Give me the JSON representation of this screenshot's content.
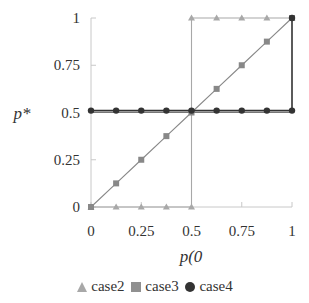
{
  "chart_data": {
    "type": "line",
    "title": "",
    "xlabel": "p(0",
    "ylabel": "p*",
    "xlim": [
      0,
      1
    ],
    "ylim": [
      0,
      1
    ],
    "grid": false,
    "legend_position": "bottom",
    "x_ticks": [
      "0",
      "0.25",
      "0.5",
      "0.75",
      "1"
    ],
    "y_ticks": [
      "0",
      "0.25",
      "0.5",
      "0.75",
      "1"
    ],
    "series": [
      {
        "name": "case2",
        "marker": "triangle",
        "color": "#a8a8a8",
        "points": [
          [
            0,
            0
          ],
          [
            0.125,
            0
          ],
          [
            0.25,
            0
          ],
          [
            0.375,
            0
          ],
          [
            0.5,
            0
          ],
          [
            0.5,
            1
          ],
          [
            0.625,
            1
          ],
          [
            0.75,
            1
          ],
          [
            0.875,
            1
          ],
          [
            1,
            1
          ]
        ]
      },
      {
        "name": "case3",
        "marker": "square",
        "color": "#888888",
        "points": [
          [
            0,
            0
          ],
          [
            0.125,
            0.125
          ],
          [
            0.25,
            0.25
          ],
          [
            0.375,
            0.375
          ],
          [
            0.5,
            0.5
          ],
          [
            0.625,
            0.625
          ],
          [
            0.75,
            0.75
          ],
          [
            0.875,
            0.875
          ],
          [
            1,
            1
          ]
        ]
      },
      {
        "name": "case4",
        "marker": "circle",
        "color": "#333333",
        "points": [
          [
            0,
            0.51
          ],
          [
            0.125,
            0.51
          ],
          [
            0.25,
            0.51
          ],
          [
            0.375,
            0.51
          ],
          [
            0.5,
            0.51
          ],
          [
            0.625,
            0.51
          ],
          [
            0.75,
            0.51
          ],
          [
            0.875,
            0.51
          ],
          [
            1,
            0.51
          ],
          [
            1,
            1
          ]
        ]
      },
      {
        "name": "baseline",
        "marker": "none",
        "color": "#777777",
        "points": [
          [
            0,
            0.5
          ],
          [
            1,
            0.5
          ]
        ]
      }
    ]
  },
  "legend": {
    "items": [
      {
        "label": "case2",
        "marker": "triangle",
        "color": "#a8a8a8"
      },
      {
        "label": "case3",
        "marker": "square",
        "color": "#909090"
      },
      {
        "label": "case4",
        "marker": "circle",
        "color": "#333333"
      }
    ]
  },
  "axes": {
    "x_title": "p(0",
    "y_title": "p*"
  }
}
